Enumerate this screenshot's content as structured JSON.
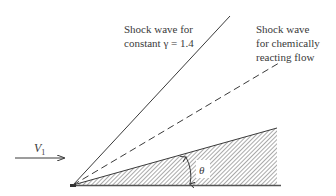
{
  "diagram": {
    "type": "oblique shock over wedge",
    "labels": {
      "shock_constant_gamma_line1": "Shock wave for",
      "shock_constant_gamma_line2": "constant γ = 1.4",
      "shock_reacting_line1": "Shock wave",
      "shock_reacting_line2": "for chemically",
      "shock_reacting_line3": "reacting flow",
      "freestream_velocity": "V",
      "freestream_velocity_subscript": "1",
      "wedge_angle": "θ"
    },
    "elements": [
      {
        "name": "shock-wave-constant-gamma",
        "style": "solid"
      },
      {
        "name": "shock-wave-chemically-reacting",
        "style": "dashed"
      },
      {
        "name": "wedge",
        "style": "hatched"
      },
      {
        "name": "freestream-arrow",
        "style": "arrow"
      },
      {
        "name": "wedge-angle-arc",
        "style": "double-arrow arc"
      }
    ],
    "colors": {
      "line": "#3a3a3a",
      "hatch": "#555555",
      "background": "#ffffff"
    }
  }
}
